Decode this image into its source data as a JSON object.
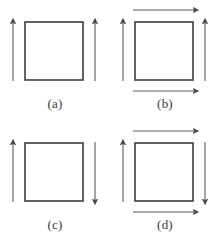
{
  "figure": {
    "background_color": "#ffffff",
    "square_stroke_color": "#3d3d3d",
    "arrow_color": "#555555",
    "label_color": "#3a3a3a",
    "panel_count": 4,
    "grid": "2 columns x 2 rows"
  },
  "panels": [
    {
      "id": "a",
      "label": "(a)",
      "square": {
        "x": 25,
        "y": 22,
        "width": 58,
        "height": 58
      },
      "arrows": [
        {
          "name": "left-arrow",
          "side": "left",
          "orientation": "vertical",
          "direction": "up"
        },
        {
          "name": "right-arrow",
          "side": "right",
          "orientation": "vertical",
          "direction": "up"
        }
      ],
      "arrow_count": 2
    },
    {
      "id": "b",
      "label": "(b)",
      "square": {
        "x": 25,
        "y": 22,
        "width": 58,
        "height": 58
      },
      "arrows": [
        {
          "name": "left-arrow",
          "side": "left",
          "orientation": "vertical",
          "direction": "up"
        },
        {
          "name": "right-arrow",
          "side": "right",
          "orientation": "vertical",
          "direction": "up"
        },
        {
          "name": "top-arrow",
          "side": "top",
          "orientation": "horizontal",
          "direction": "right"
        },
        {
          "name": "bottom-arrow",
          "side": "bottom",
          "orientation": "horizontal",
          "direction": "right"
        }
      ],
      "arrow_count": 4
    },
    {
      "id": "c",
      "label": "(c)",
      "square": {
        "x": 25,
        "y": 22,
        "width": 58,
        "height": 58
      },
      "arrows": [
        {
          "name": "left-arrow",
          "side": "left",
          "orientation": "vertical",
          "direction": "up"
        },
        {
          "name": "right-arrow",
          "side": "right",
          "orientation": "vertical",
          "direction": "down"
        }
      ],
      "arrow_count": 2
    },
    {
      "id": "d",
      "label": "(d)",
      "square": {
        "x": 25,
        "y": 22,
        "width": 58,
        "height": 58
      },
      "arrows": [
        {
          "name": "left-arrow",
          "side": "left",
          "orientation": "vertical",
          "direction": "up"
        },
        {
          "name": "right-arrow",
          "side": "right",
          "orientation": "vertical",
          "direction": "down"
        },
        {
          "name": "top-arrow",
          "side": "top",
          "orientation": "horizontal",
          "direction": "right"
        },
        {
          "name": "bottom-arrow",
          "side": "bottom",
          "orientation": "horizontal",
          "direction": "right"
        }
      ],
      "arrow_count": 4
    }
  ]
}
